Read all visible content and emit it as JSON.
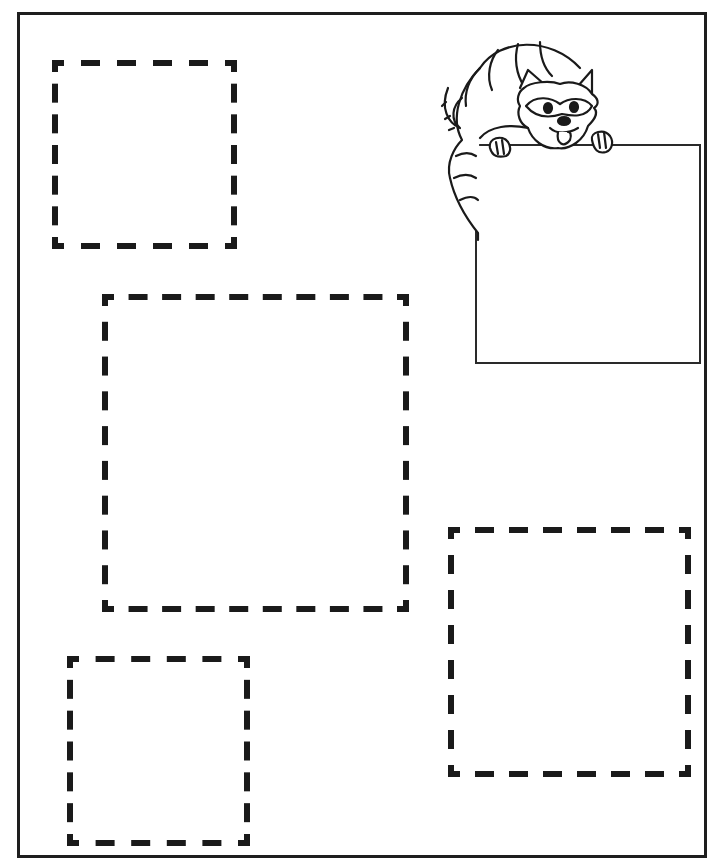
{
  "worksheet": {
    "title": "",
    "ink_color": "#1a1a1a",
    "background": "#ffffff",
    "page_border": {
      "x": 17,
      "y": 12,
      "w": 690,
      "h": 846
    },
    "tracing_squares": [
      {
        "id": "square-1",
        "x": 52,
        "y": 60,
        "w": 185,
        "h": 189
      },
      {
        "id": "square-2",
        "x": 102,
        "y": 294,
        "w": 307,
        "h": 318
      },
      {
        "id": "square-3",
        "x": 448,
        "y": 527,
        "w": 243,
        "h": 250
      },
      {
        "id": "square-4",
        "x": 67,
        "y": 656,
        "w": 183,
        "h": 190
      }
    ],
    "example_square": {
      "x": 475,
      "y": 144,
      "w": 226,
      "h": 220
    },
    "mascot": {
      "name": "raccoon",
      "icon": "raccoon-icon"
    }
  }
}
